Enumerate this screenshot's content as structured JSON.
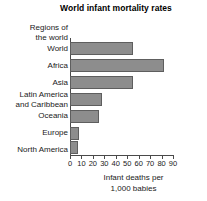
{
  "chart_data": {
    "type": "bar",
    "orientation": "horizontal",
    "title": "World infant mortality rates",
    "category_axis_heading": "Regions of the world",
    "category_axis_heading_lines": [
      "Regions of",
      "the world"
    ],
    "categories": [
      "World",
      "Africa",
      "Asia",
      "Latin America and Caribbean",
      "Oceania",
      "Europe",
      "North America"
    ],
    "category_display": [
      {
        "lines": [
          "World"
        ]
      },
      {
        "lines": [
          "Africa"
        ]
      },
      {
        "lines": [
          "Asia"
        ]
      },
      {
        "lines": [
          "Latin America",
          "and Caribbean"
        ]
      },
      {
        "lines": [
          "Oceania"
        ]
      },
      {
        "lines": [
          "Europe"
        ]
      },
      {
        "lines": [
          "North America"
        ]
      }
    ],
    "values": [
      55,
      82,
      55,
      28,
      25,
      8,
      7
    ],
    "bars": [
      {
        "label": "World",
        "value": 55
      },
      {
        "label": "Africa",
        "value": 82
      },
      {
        "label": "Asia",
        "value": 55
      },
      {
        "label": "Latin America and Caribbean",
        "value": 28
      },
      {
        "label": "Oceania",
        "value": 25
      },
      {
        "label": "Europe",
        "value": 8
      },
      {
        "label": "North America",
        "value": 7
      }
    ],
    "xlabel": "Infant deaths per 1,000 babies",
    "xlabel_lines": [
      "Infant deaths per",
      "1,000 babies"
    ],
    "ylabel": "Regions of the world",
    "xlim": [
      0,
      90
    ],
    "xticks": [
      0,
      10,
      20,
      30,
      40,
      50,
      60,
      70,
      80,
      90
    ],
    "xtick_labels": [
      "0",
      "10",
      "20",
      "30",
      "40",
      "50",
      "60",
      "70",
      "80",
      "90"
    ],
    "grid": false,
    "legend": false,
    "bar_color": "#8d8d8d",
    "bar_border_color": "#5e5e5e",
    "axis_color": "#4a4a4a",
    "background": "#ffffff"
  }
}
